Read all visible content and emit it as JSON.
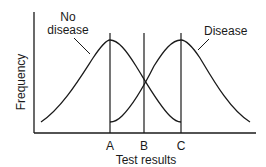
{
  "diagram": {
    "type": "overlapping-distributions",
    "y_axis_label": "Frequency",
    "x_axis_label": "Test results",
    "curves": [
      {
        "name": "no_disease",
        "label_line1": "No",
        "label_line2": "disease"
      },
      {
        "name": "disease",
        "label": "Disease"
      }
    ],
    "cutoffs": [
      "A",
      "B",
      "C"
    ],
    "colors": {
      "line": "#1a1a1a",
      "background": "#ffffff"
    }
  }
}
